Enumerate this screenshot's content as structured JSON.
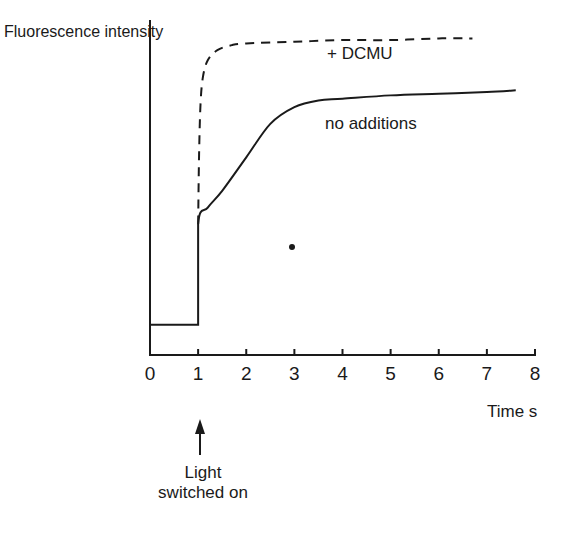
{
  "chart_data": {
    "type": "line",
    "title": "",
    "xlabel": "Time s",
    "ylabel": "Fluorescence intensity",
    "xlim": [
      0,
      8
    ],
    "ylim": [
      0,
      1
    ],
    "grid": false,
    "legend": "inline labels",
    "x_ticks": [
      "0",
      "1",
      "2",
      "3",
      "4",
      "5",
      "6",
      "7",
      "8"
    ],
    "series": [
      {
        "name": "no additions",
        "style": "solid",
        "x": [
          0,
          1,
          1,
          1.2,
          1.5,
          2,
          2.5,
          3,
          3.5,
          4,
          5,
          6,
          7,
          7.6
        ],
        "values": [
          0.09,
          0.09,
          0.39,
          0.44,
          0.49,
          0.59,
          0.69,
          0.74,
          0.76,
          0.765,
          0.775,
          0.78,
          0.785,
          0.79
        ]
      },
      {
        "name": "+DCMU",
        "style": "dashed",
        "x": [
          1,
          1.02,
          1.05,
          1.1,
          1.2,
          1.4,
          1.7,
          2,
          3,
          4,
          5,
          6,
          6.7
        ],
        "values": [
          0.39,
          0.6,
          0.75,
          0.83,
          0.88,
          0.91,
          0.925,
          0.93,
          0.935,
          0.94,
          0.94,
          0.945,
          0.945
        ]
      }
    ],
    "annotations": [
      {
        "text": "Light switched on",
        "x": 1,
        "arrow": "up",
        "position": "below x-axis"
      }
    ]
  },
  "labels": {
    "ylabel": "Fluorescence intensity",
    "xlabel": "Time s",
    "dcmu": "+ DCMU",
    "no_additions": "no additions",
    "light_annotation": "Light switched on",
    "ticks": [
      "0",
      "1",
      "2",
      "3",
      "4",
      "5",
      "6",
      "7",
      "8"
    ]
  },
  "colors": {
    "ink": "#1a1a1a",
    "background": "#ffffff"
  }
}
